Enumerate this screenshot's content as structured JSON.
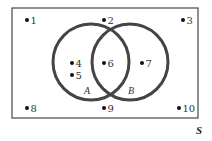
{
  "diagram": {
    "type": "venn",
    "universe": {
      "label": "S",
      "x": 12,
      "y": 8,
      "width": 186,
      "height": 110,
      "color": "#555555"
    },
    "sets": [
      {
        "label": "A",
        "cx": 91,
        "cy": 62,
        "r": 38,
        "color": "#444444",
        "label_x": 84,
        "label_y": 94
      },
      {
        "label": "B",
        "cx": 130,
        "cy": 62,
        "r": 38,
        "color": "#444444",
        "label_x": 128,
        "label_y": 94
      }
    ],
    "points": [
      {
        "label": "1",
        "x": 27,
        "y": 20,
        "region": "outside"
      },
      {
        "label": "2",
        "x": 104,
        "y": 20,
        "region": "outside"
      },
      {
        "label": "3",
        "x": 183,
        "y": 20,
        "region": "outside"
      },
      {
        "label": "4",
        "x": 72,
        "y": 63,
        "region": "A only"
      },
      {
        "label": "5",
        "x": 72,
        "y": 75,
        "region": "A only"
      },
      {
        "label": "6",
        "x": 104,
        "y": 63,
        "region": "A and B"
      },
      {
        "label": "7",
        "x": 142,
        "y": 63,
        "region": "B only"
      },
      {
        "label": "8",
        "x": 27,
        "y": 108,
        "region": "outside"
      },
      {
        "label": "9",
        "x": 104,
        "y": 108,
        "region": "outside"
      },
      {
        "label": "10",
        "x": 179,
        "y": 108,
        "region": "outside"
      }
    ]
  }
}
